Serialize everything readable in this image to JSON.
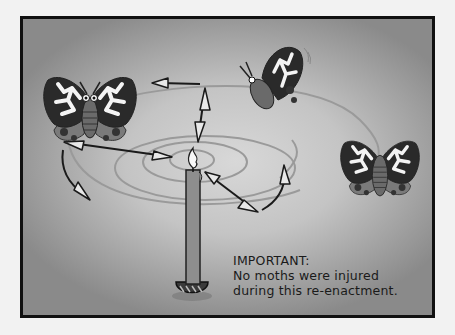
{
  "comic": {
    "caption": {
      "heading": "IMPORTANT:",
      "line1": "No moths were injured",
      "line2": "during this re-enactment."
    },
    "elements": [
      "candle",
      "flame",
      "spiral-flight-path",
      "moth-left",
      "moth-top",
      "moth-right",
      "direction-arrows"
    ],
    "colors": {
      "frame_border": "#111111",
      "background_center": "#d8d8d8",
      "background_edge": "#8a8a8a",
      "candle": "#8e8e8e",
      "spiral": "#9a9a9a",
      "moth_wing_dark": "#2a2a2a",
      "moth_pattern": "#f4f4f4"
    }
  }
}
